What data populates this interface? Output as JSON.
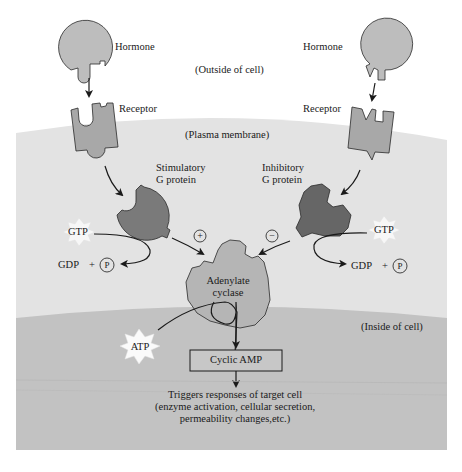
{
  "regions": {
    "outside": "(Outside of cell)",
    "membrane": "(Plasma membrane)",
    "inside": "(Inside of cell)"
  },
  "left_pathway": {
    "hormone": "Hormone",
    "receptor": "Receptor",
    "g_protein_line1": "Stimulatory",
    "g_protein_line2": "G protein",
    "gtp": "GTP",
    "gdp": "GDP",
    "plus": "+",
    "phosphate": "P",
    "effect_sign": "+"
  },
  "right_pathway": {
    "hormone": "Hormone",
    "receptor": "Receptor",
    "g_protein_line1": "Inhibitory",
    "g_protein_line2": "G protein",
    "gtp": "GTP",
    "gdp": "GDP",
    "plus": "+",
    "phosphate": "P",
    "effect_sign": "−"
  },
  "enzyme": {
    "line1": "Adenylate",
    "line2": "cyclase"
  },
  "atp": "ATP",
  "product": "Cyclic AMP",
  "response": {
    "line1": "Triggers responses of target cell",
    "line2": "(enzyme activation, cellular secretion,",
    "line3": "permeability changes,etc.)"
  },
  "colors": {
    "outside_bg": "#ffffff",
    "membrane_bg": "#e3e3e3",
    "inside_bg": "#c2c2c2",
    "hormone_fill": "#bdbdbd",
    "receptor_fill": "#a8a8a8",
    "g_stim_fill": "#7a7a7a",
    "g_inhib_fill": "#666666",
    "cyclase_fill": "#b5b5b5",
    "outline": "#2a2a2a"
  }
}
